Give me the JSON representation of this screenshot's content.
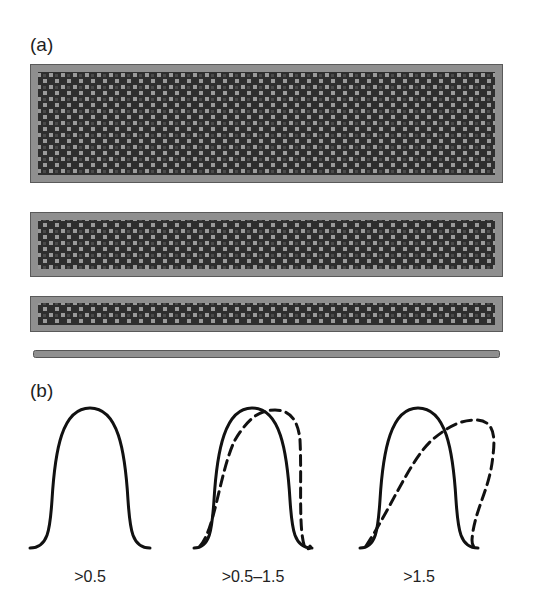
{
  "panels": {
    "a": {
      "label": "(a)",
      "slabs": [
        {
          "name": "slab-thick",
          "x": 30,
          "y": 64,
          "width": 473,
          "height": 119
        },
        {
          "name": "slab-medium",
          "x": 30,
          "y": 212,
          "width": 473,
          "height": 65
        },
        {
          "name": "slab-thin",
          "x": 30,
          "y": 296,
          "width": 473,
          "height": 36
        },
        {
          "name": "slab-line",
          "x": 33,
          "y": 350,
          "width": 467,
          "height": 8
        }
      ],
      "colors": {
        "frame": "#8f8f8f",
        "border": "#5a5a5a",
        "core": "#2e2e2e",
        "dots": "#9a9a9a"
      }
    },
    "b": {
      "label": "(b)",
      "profiles": [
        {
          "label": ">0.5",
          "solid": true,
          "dashed": false
        },
        {
          "label": ">0.5–1.5",
          "solid": true,
          "dashed": true
        },
        {
          "label": ">1.5",
          "solid": true,
          "dashed": true
        }
      ]
    }
  }
}
